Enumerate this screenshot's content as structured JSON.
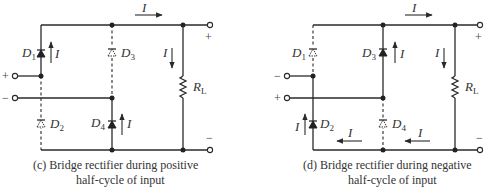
{
  "diagrams": [
    {
      "id": "c",
      "caption_line1": "(c) Bridge rectifier during positive",
      "caption_line2": "half-cycle of input",
      "input_top_sign": "+",
      "input_bottom_sign": "−",
      "output_top_sign": "+",
      "output_bottom_sign": "−",
      "diodes": {
        "D1": {
          "label": "D",
          "sub": "1",
          "state": "conducting"
        },
        "D2": {
          "label": "D",
          "sub": "2",
          "state": "off"
        },
        "D3": {
          "label": "D",
          "sub": "3",
          "state": "off"
        },
        "D4": {
          "label": "D",
          "sub": "4",
          "state": "conducting"
        }
      },
      "load": {
        "label": "R",
        "sub": "L"
      },
      "current_label": "I"
    },
    {
      "id": "d",
      "caption_line1": "(d) Bridge rectifier during negative",
      "caption_line2": "half-cycle of input",
      "input_top_sign": "−",
      "input_bottom_sign": "+",
      "output_top_sign": "+",
      "output_bottom_sign": "−",
      "diodes": {
        "D1": {
          "label": "D",
          "sub": "1",
          "state": "off"
        },
        "D2": {
          "label": "D",
          "sub": "2",
          "state": "conducting"
        },
        "D3": {
          "label": "D",
          "sub": "3",
          "state": "conducting"
        },
        "D4": {
          "label": "D",
          "sub": "4",
          "state": "off"
        }
      },
      "load": {
        "label": "R",
        "sub": "L"
      },
      "current_label": "I"
    }
  ]
}
